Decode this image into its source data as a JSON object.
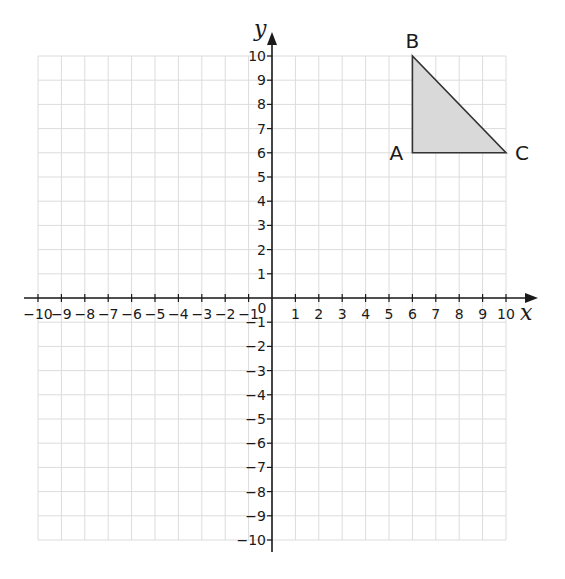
{
  "chart_data": {
    "type": "scatter",
    "title": "",
    "xlabel": "x",
    "ylabel": "y",
    "xlim": [
      -10,
      10
    ],
    "ylim": [
      -10,
      10
    ],
    "grid": true,
    "x_ticks": [
      -10,
      -9,
      -8,
      -7,
      -6,
      -5,
      -4,
      -3,
      -2,
      -1,
      1,
      2,
      3,
      4,
      5,
      6,
      7,
      8,
      9,
      10
    ],
    "y_ticks": [
      -10,
      -9,
      -8,
      -7,
      -6,
      -5,
      -4,
      -3,
      -2,
      -1,
      1,
      2,
      3,
      4,
      5,
      6,
      7,
      8,
      9,
      10
    ],
    "origin_label": "0",
    "shapes": [
      {
        "name": "triangle ABC",
        "fill": "#d9d9d9",
        "stroke": "#333333",
        "vertices": [
          {
            "label": "A",
            "x": 6,
            "y": 6
          },
          {
            "label": "B",
            "x": 6,
            "y": 10
          },
          {
            "label": "C",
            "x": 10,
            "y": 6
          }
        ]
      }
    ]
  },
  "colors": {
    "grid": "#dcdcdc",
    "axis": "#1a1a1a",
    "triangle_fill": "#d9d9d9",
    "triangle_stroke": "#333333"
  }
}
